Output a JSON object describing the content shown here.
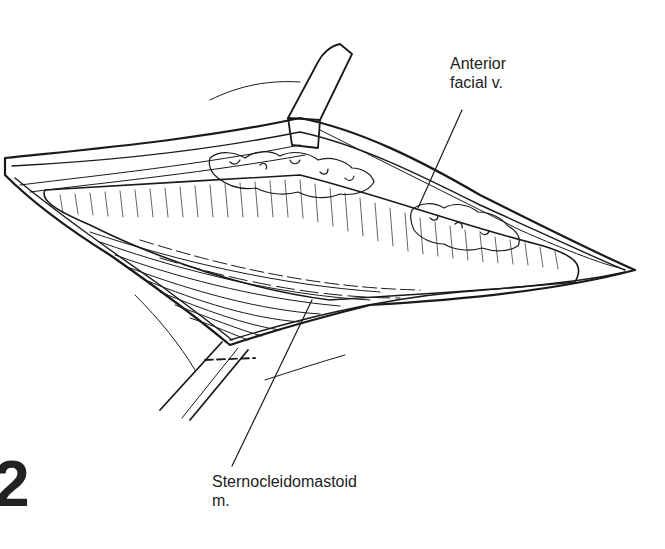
{
  "figure": {
    "number": "2",
    "labels": {
      "anterior_facial_v_line1": "Anterior",
      "anterior_facial_v_line2": "facial v.",
      "sternocleidomastoid_line1": "Sternocleidomastoid",
      "sternocleidomastoid_line2": "m."
    }
  },
  "colors": {
    "ink": "#1a1a1a",
    "background": "#ffffff"
  }
}
